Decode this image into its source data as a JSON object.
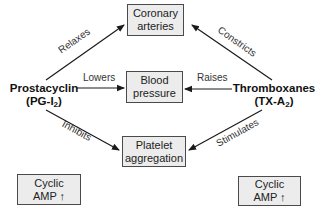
{
  "diagram": {
    "title": "",
    "colors": {
      "box_fill": "#ececec",
      "box_border": "#4a4a4a",
      "arrow": "#1a1a1a",
      "text": "#222222"
    },
    "nodes": {
      "coronary": {
        "line1": "Coronary",
        "line2": "arteries"
      },
      "blood_pressure": {
        "line1": "Blood",
        "line2": "pressure"
      },
      "platelet": {
        "line1": "Platelet",
        "line2": "aggregation"
      },
      "prostacyclin": {
        "name": "Prostacyclin",
        "abbr_prefix": "(PG-I",
        "abbr_sub": "2",
        "abbr_suffix": ")"
      },
      "thromboxanes": {
        "name": "Thromboxanes",
        "abbr_prefix": "(TX-A",
        "abbr_sub": "2",
        "abbr_suffix": ")"
      },
      "camp_left": {
        "line1": "Cyclic",
        "line2": "AMP ↑"
      },
      "camp_right": {
        "line1": "Cyclic",
        "line2": "AMP ↑"
      }
    },
    "edges": [
      {
        "from": "prostacyclin",
        "to": "coronary",
        "label": "Relaxes"
      },
      {
        "from": "prostacyclin",
        "to": "blood_pressure",
        "label": "Lowers"
      },
      {
        "from": "prostacyclin",
        "to": "platelet",
        "label": "Inhibits"
      },
      {
        "from": "thromboxanes",
        "to": "coronary",
        "label": "Constricts"
      },
      {
        "from": "thromboxanes",
        "to": "blood_pressure",
        "label": "Raises"
      },
      {
        "from": "thromboxanes",
        "to": "platelet",
        "label": "Stimulates"
      }
    ]
  }
}
